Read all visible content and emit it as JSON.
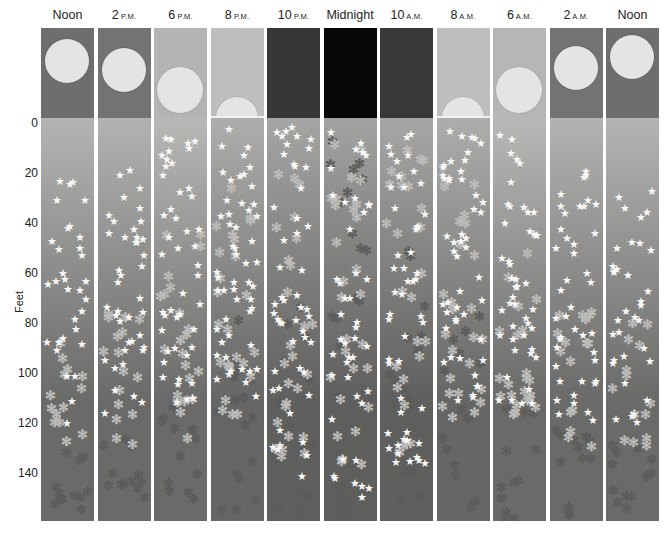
{
  "figure": {
    "axis": {
      "title": "Feet",
      "ticks": [
        "0",
        "20",
        "40",
        "60",
        "80",
        "100",
        "120",
        "140"
      ],
      "px_per_ft": 2.5,
      "zero_y": 121
    },
    "legend_semantics": {
      "star": "white star organisms",
      "ast_light": "light asterisk organisms",
      "ast_dark": "dark asterisk organisms"
    },
    "columns": [
      {
        "time": "Noon",
        "suffix": "",
        "sky": "#6e6e6c",
        "sun": {
          "cx": 26,
          "cy": 33,
          "r": 22
        },
        "water_top": "#b4b4b2",
        "water_bottom": "#6a6a68",
        "star": {
          "min": 22,
          "max": 120,
          "n": 32
        },
        "ast_light": {
          "min": 80,
          "max": 128,
          "n": 14
        },
        "ast_dark": {
          "min": 128,
          "max": 158,
          "n": 12
        }
      },
      {
        "time": "2",
        "suffix": "P.M.",
        "sky": "#737371",
        "sun": {
          "cx": 26,
          "cy": 42,
          "r": 22
        },
        "water_top": "#b2b2b0",
        "water_bottom": "#6a6a68",
        "star": {
          "min": 16,
          "max": 118,
          "n": 40
        },
        "ast_light": {
          "min": 70,
          "max": 130,
          "n": 16
        },
        "ast_dark": {
          "min": 115,
          "max": 158,
          "n": 12
        }
      },
      {
        "time": "6",
        "suffix": "P.M.",
        "sky": "#b4b4b2",
        "sun": {
          "cx": 26,
          "cy": 62,
          "r": 23
        },
        "water_top": "#b8b8b6",
        "water_bottom": "#6a6a68",
        "star": {
          "min": 4,
          "max": 112,
          "n": 46
        },
        "ast_light": {
          "min": 40,
          "max": 128,
          "n": 22
        },
        "ast_dark": {
          "min": 110,
          "max": 158,
          "n": 12
        }
      },
      {
        "time": "8",
        "suffix": "P.M.",
        "sky": "#bebebc",
        "sun": {
          "cx": 26,
          "cy": 90,
          "r": 21
        },
        "water_top": "#adadab",
        "water_bottom": "#666664",
        "star": {
          "min": 1,
          "max": 110,
          "n": 52
        },
        "ast_light": {
          "min": 25,
          "max": 120,
          "n": 24
        },
        "ast_dark": {
          "min": 65,
          "max": 158,
          "n": 16
        }
      },
      {
        "time": "10",
        "suffix": "P.M.",
        "sky": "#373736",
        "sun": null,
        "water_top": "#a5a5a3",
        "water_bottom": "#5f5f5d",
        "star": {
          "min": 1,
          "max": 145,
          "n": 50
        },
        "ast_light": {
          "min": 10,
          "max": 140,
          "n": 26
        },
        "ast_dark": {
          "min": 60,
          "max": 158,
          "n": 18
        }
      },
      {
        "time": "Midnight",
        "suffix": "",
        "sky": "#070707",
        "sun": null,
        "water_top": "#a2a2a0",
        "water_bottom": "#5e5e5c",
        "star": {
          "min": 1,
          "max": 150,
          "n": 44
        },
        "ast_light": {
          "min": 5,
          "max": 145,
          "n": 28
        },
        "ast_dark": {
          "min": 5,
          "max": 158,
          "n": 22
        }
      },
      {
        "time": "10",
        "suffix": "A.M.",
        "sky": "#383837",
        "sun": null,
        "water_top": "#a6a6a4",
        "water_bottom": "#5f5f5d",
        "star": {
          "min": 1,
          "max": 140,
          "n": 50
        },
        "ast_light": {
          "min": 10,
          "max": 140,
          "n": 26
        },
        "ast_dark": {
          "min": 50,
          "max": 158,
          "n": 18
        }
      },
      {
        "time": "8",
        "suffix": "A.M.",
        "sky": "#bebebc",
        "sun": {
          "cx": 26,
          "cy": 90,
          "r": 21
        },
        "water_top": "#adadab",
        "water_bottom": "#666664",
        "star": {
          "min": 1,
          "max": 112,
          "n": 50
        },
        "ast_light": {
          "min": 20,
          "max": 125,
          "n": 24
        },
        "ast_dark": {
          "min": 70,
          "max": 158,
          "n": 16
        }
      },
      {
        "time": "6",
        "suffix": "A.M.",
        "sky": "#b6b6b4",
        "sun": {
          "cx": 26,
          "cy": 62,
          "r": 23
        },
        "water_top": "#b8b8b6",
        "water_bottom": "#6a6a68",
        "star": {
          "min": 4,
          "max": 112,
          "n": 46
        },
        "ast_light": {
          "min": 40,
          "max": 128,
          "n": 22
        },
        "ast_dark": {
          "min": 110,
          "max": 158,
          "n": 12
        }
      },
      {
        "time": "2",
        "suffix": "A.M.",
        "sky": "#737371",
        "sun": {
          "cx": 26,
          "cy": 40,
          "r": 22
        },
        "water_top": "#b2b2b0",
        "water_bottom": "#6a6a68",
        "star": {
          "min": 14,
          "max": 122,
          "n": 42
        },
        "ast_light": {
          "min": 68,
          "max": 130,
          "n": 16
        },
        "ast_dark": {
          "min": 118,
          "max": 158,
          "n": 12
        }
      },
      {
        "time": "Noon",
        "suffix": "",
        "sky": "#6e6e6c",
        "sun": {
          "cx": 26,
          "cy": 29,
          "r": 22
        },
        "water_top": "#b4b4b2",
        "water_bottom": "#6a6a68",
        "star": {
          "min": 22,
          "max": 122,
          "n": 34
        },
        "ast_light": {
          "min": 78,
          "max": 130,
          "n": 14
        },
        "ast_dark": {
          "min": 125,
          "max": 158,
          "n": 12
        }
      }
    ],
    "layout": {
      "first_left": 41,
      "pitch": 56.5,
      "col_width": 53
    }
  },
  "glyphs": {
    "star": "★",
    "ast_light": "✻",
    "ast_dark": "✻"
  }
}
